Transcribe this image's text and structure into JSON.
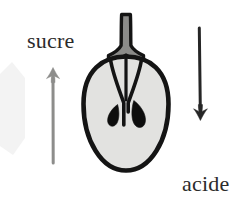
{
  "figure": {
    "background_color": "#ffffff"
  },
  "labels": {
    "sucre": "sucre",
    "acide": "acide"
  },
  "arrows": {
    "sugar": {
      "name": "sucre-arrow",
      "direction": "up",
      "color": "#8a8a88",
      "x": 53,
      "y_tail": 163,
      "y_head": 68
    },
    "acid": {
      "name": "acide-arrow",
      "direction": "down",
      "color": "#2a2a2a",
      "x": 200,
      "y_tail": 28,
      "y_head": 119
    }
  },
  "apple": {
    "name": "apple-cross-section",
    "body_fill": "#e2e2e0",
    "outline_color": "#141414",
    "stem_fill": "#8b8b89",
    "seed_fill": "#0d0d0d",
    "seed_count": 2,
    "center_x": 126,
    "body_top": 55,
    "body_bottom": 172
  },
  "watermark": {
    "name": "background-polygon",
    "color": "#f3f3f3"
  },
  "colors": {
    "sugar_accent": "#8a8a88",
    "acid_accent": "#2a2a2a",
    "text": "#2b2b2b"
  }
}
